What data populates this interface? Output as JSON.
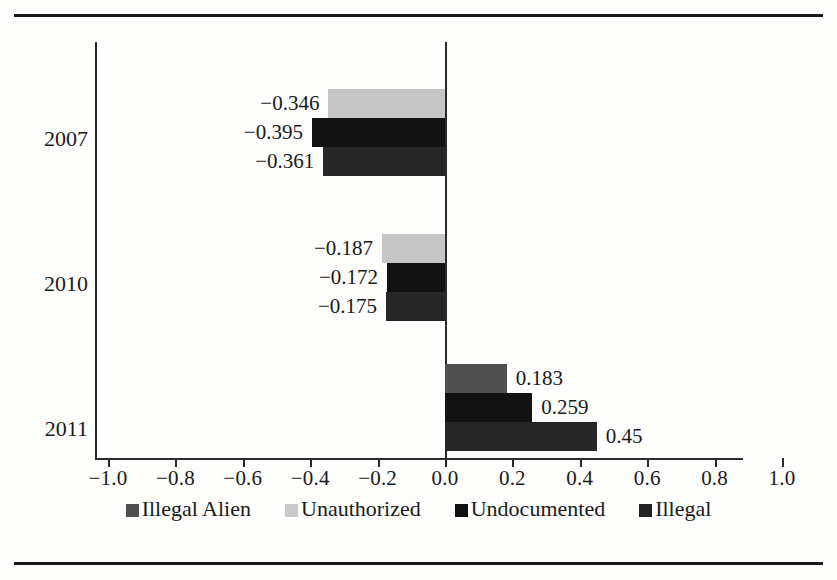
{
  "chart_data": {
    "type": "bar",
    "orientation": "horizontal",
    "title": "",
    "subtitle": "",
    "xlabel": "",
    "ylabel": "",
    "categories": [
      "2007",
      "2010",
      "2011"
    ],
    "xlim": [
      -1.0,
      1.0
    ],
    "xticks": [
      "-1.0",
      "-0.8",
      "-0.6",
      "-0.4",
      "-0.2",
      "0.0",
      "0.2",
      "0.4",
      "0.6",
      "0.8",
      "1.0"
    ],
    "xtick_values": [
      -1.0,
      -0.8,
      -0.6,
      -0.4,
      -0.2,
      0.0,
      0.2,
      0.4,
      0.6,
      0.8,
      1.0
    ],
    "grid": false,
    "legend_position": "bottom",
    "series": [
      {
        "name": "Illegal Alien",
        "color": "#4f4f4f",
        "values": [
          null,
          null,
          0.183
        ]
      },
      {
        "name": "Unauthorized",
        "color": "#c6c6c6",
        "values": [
          -0.346,
          -0.187,
          null
        ]
      },
      {
        "name": "Undocumented",
        "color": "#121212",
        "values": [
          -0.395,
          -0.172,
          0.259
        ]
      },
      {
        "name": "Illegal",
        "color": "#262626",
        "values": [
          -0.361,
          -0.175,
          0.45
        ]
      }
    ],
    "bars": [
      {
        "group": "2007",
        "series": "Unauthorized",
        "value": -0.346,
        "label": "−0.346",
        "color": "#c6c6c6"
      },
      {
        "group": "2007",
        "series": "Undocumented",
        "value": -0.395,
        "label": "−0.395",
        "color": "#121212"
      },
      {
        "group": "2007",
        "series": "Illegal",
        "value": -0.361,
        "label": "−0.361",
        "color": "#262626"
      },
      {
        "group": "2010",
        "series": "Unauthorized",
        "value": -0.187,
        "label": "−0.187",
        "color": "#c6c6c6"
      },
      {
        "group": "2010",
        "series": "Undocumented",
        "value": -0.172,
        "label": "−0.172",
        "color": "#121212"
      },
      {
        "group": "2010",
        "series": "Illegal",
        "value": -0.175,
        "label": "−0.175",
        "color": "#262626"
      },
      {
        "group": "2011",
        "series": "Illegal Alien",
        "value": 0.183,
        "label": "0.183",
        "color": "#4f4f4f"
      },
      {
        "group": "2011",
        "series": "Undocumented",
        "value": 0.259,
        "label": "0.259",
        "color": "#121212"
      },
      {
        "group": "2011",
        "series": "Illegal",
        "value": 0.45,
        "label": "0.45",
        "color": "#262626"
      }
    ]
  },
  "axis": {
    "ticks": [
      {
        "label": "−1.0",
        "value": -1.0
      },
      {
        "label": "−0.8",
        "value": -0.8
      },
      {
        "label": "−0.6",
        "value": -0.6
      },
      {
        "label": "−0.4",
        "value": -0.4
      },
      {
        "label": "−0.2",
        "value": -0.2
      },
      {
        "label": "0.0",
        "value": 0.0
      },
      {
        "label": "0.2",
        "value": 0.2
      },
      {
        "label": "0.4",
        "value": 0.4
      },
      {
        "label": "0.6",
        "value": 0.6
      },
      {
        "label": "0.8",
        "value": 0.8
      },
      {
        "label": "1.0",
        "value": 1.0
      }
    ],
    "years": [
      {
        "label": "2007",
        "center": 97
      },
      {
        "label": "2010",
        "center": 242
      },
      {
        "label": "2011",
        "center": 387
      }
    ]
  },
  "legend": {
    "items": [
      {
        "label": "Illegal Alien",
        "swatch": "illegal-alien"
      },
      {
        "label": "Unauthorized",
        "swatch": "unauthorized"
      },
      {
        "label": "Undocumented",
        "swatch": "undocumented"
      },
      {
        "label": "Illegal",
        "swatch": "illegal"
      }
    ]
  }
}
